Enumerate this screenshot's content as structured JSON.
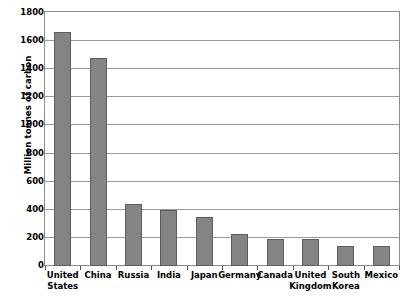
{
  "chart_data": {
    "type": "bar",
    "title": "",
    "xlabel": "",
    "ylabel": "Million tonnes of carbon",
    "ylim": [
      0,
      1800
    ],
    "ytick_step": 200,
    "yticks": [
      0,
      200,
      400,
      600,
      800,
      1000,
      1200,
      1400,
      1600,
      1800
    ],
    "grid": true,
    "legend": "none",
    "categories": [
      "United\nStates",
      "China",
      "Russia",
      "India",
      "Japan",
      "Germany",
      "Canada",
      "United\nKingdom",
      "South\nKorea",
      "Mexico"
    ],
    "values": [
      1665,
      1480,
      440,
      400,
      350,
      230,
      190,
      190,
      145,
      140
    ],
    "bar_color": "#848484",
    "bar_border_color": "#5d5d5d",
    "gridline_color": "#9a9a9a",
    "plot_border_color": "#8c8c8c",
    "background_color": "#ffffff"
  }
}
